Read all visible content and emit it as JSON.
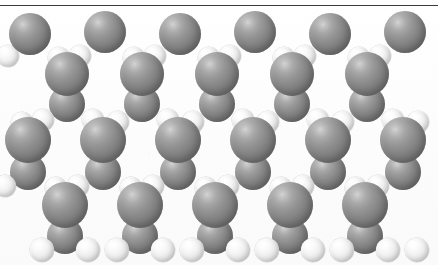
{
  "figure": {
    "title": "",
    "width": 438,
    "height": 265,
    "background_color": "#fdfdfd",
    "rule_color": "#3b3b3b",
    "style": "space-filling (CPK) model, grayscale halftone scan"
  },
  "legend": {
    "heavy_atom_label": "",
    "light_atom_label": "",
    "heavy_atom_color": "#8a8a8a",
    "light_atom_color": "#eeeeee"
  },
  "structure": {
    "description": "",
    "lattice_rows": 3,
    "repeat_units_across": 6,
    "horizontal_period_px": 75,
    "heavy_radius_px": 21,
    "light_radius_px": 11
  },
  "atoms": [
    {
      "id": "h-top-1",
      "kind": "heavy",
      "cx": 30,
      "cy": 34,
      "r": 21,
      "z": 30
    },
    {
      "id": "h-top-2",
      "kind": "heavy",
      "cx": 105,
      "cy": 32,
      "r": 21,
      "z": 30
    },
    {
      "id": "h-top-3",
      "kind": "heavy",
      "cx": 180,
      "cy": 34,
      "r": 21,
      "z": 30
    },
    {
      "id": "h-top-4",
      "kind": "heavy",
      "cx": 255,
      "cy": 32,
      "r": 21,
      "z": 30
    },
    {
      "id": "h-top-5",
      "kind": "heavy",
      "cx": 330,
      "cy": 34,
      "r": 21,
      "z": 30
    },
    {
      "id": "h-top-6",
      "kind": "heavy",
      "cx": 405,
      "cy": 32,
      "r": 21,
      "z": 30
    },
    {
      "id": "l-top-1",
      "cx": 59,
      "cy": 58,
      "r": 11,
      "kind": "light",
      "z": 28
    },
    {
      "id": "l-top-2",
      "cx": 80,
      "cy": 56,
      "r": 11,
      "kind": "light",
      "z": 28
    },
    {
      "id": "l-top-3",
      "cx": 134,
      "cy": 58,
      "r": 11,
      "kind": "light",
      "z": 28
    },
    {
      "id": "l-top-4",
      "cx": 155,
      "cy": 56,
      "r": 11,
      "kind": "light",
      "z": 28
    },
    {
      "id": "l-top-5",
      "cx": 209,
      "cy": 58,
      "r": 11,
      "kind": "light",
      "z": 28
    },
    {
      "id": "l-top-6",
      "cx": 230,
      "cy": 56,
      "r": 11,
      "kind": "light",
      "z": 28
    },
    {
      "id": "l-top-7",
      "cx": 284,
      "cy": 58,
      "r": 11,
      "kind": "light",
      "z": 28
    },
    {
      "id": "l-top-8",
      "cx": 305,
      "cy": 56,
      "r": 11,
      "kind": "light",
      "z": 28
    },
    {
      "id": "l-top-9",
      "cx": 359,
      "cy": 58,
      "r": 11,
      "kind": "light",
      "z": 28
    },
    {
      "id": "l-top-10",
      "cx": 380,
      "cy": 56,
      "r": 11,
      "kind": "light",
      "z": 28
    },
    {
      "id": "l-top-0",
      "cx": 8,
      "cy": 56,
      "r": 11,
      "kind": "light",
      "z": 28
    },
    {
      "id": "h-r1-1",
      "cx": 67,
      "cy": 74,
      "r": 22,
      "kind": "heavy",
      "z": 34
    },
    {
      "id": "h-r1-2",
      "cx": 142,
      "cy": 74,
      "r": 22,
      "kind": "heavy",
      "z": 34
    },
    {
      "id": "h-r1-3",
      "cx": 217,
      "cy": 74,
      "r": 22,
      "kind": "heavy",
      "z": 34
    },
    {
      "id": "h-r1-4",
      "cx": 292,
      "cy": 74,
      "r": 22,
      "kind": "heavy",
      "z": 34
    },
    {
      "id": "h-r1-5",
      "cx": 367,
      "cy": 74,
      "r": 22,
      "kind": "heavy",
      "z": 34
    },
    {
      "id": "h-r1b-1",
      "cx": 67,
      "cy": 104,
      "r": 18,
      "kind": "heavy",
      "z": 24
    },
    {
      "id": "h-r1b-2",
      "cx": 142,
      "cy": 104,
      "r": 18,
      "kind": "heavy",
      "z": 24
    },
    {
      "id": "h-r1b-3",
      "cx": 217,
      "cy": 104,
      "r": 18,
      "kind": "heavy",
      "z": 24
    },
    {
      "id": "h-r1b-4",
      "cx": 292,
      "cy": 104,
      "r": 18,
      "kind": "heavy",
      "z": 24
    },
    {
      "id": "h-r1b-5",
      "cx": 367,
      "cy": 104,
      "r": 18,
      "kind": "heavy",
      "z": 24
    },
    {
      "id": "l-m-1",
      "cx": 43,
      "cy": 120,
      "r": 11,
      "kind": "light",
      "z": 26
    },
    {
      "id": "l-m-2",
      "cx": 22,
      "cy": 123,
      "r": 11,
      "kind": "light",
      "z": 26
    },
    {
      "id": "l-m-3",
      "cx": 93,
      "cy": 120,
      "r": 11,
      "kind": "light",
      "z": 26
    },
    {
      "id": "l-m-4",
      "cx": 118,
      "cy": 122,
      "r": 11,
      "kind": "light",
      "z": 26
    },
    {
      "id": "l-m-5",
      "cx": 168,
      "cy": 120,
      "r": 11,
      "kind": "light",
      "z": 26
    },
    {
      "id": "l-m-6",
      "cx": 193,
      "cy": 122,
      "r": 11,
      "kind": "light",
      "z": 26
    },
    {
      "id": "l-m-7",
      "cx": 243,
      "cy": 120,
      "r": 11,
      "kind": "light",
      "z": 26
    },
    {
      "id": "l-m-8",
      "cx": 268,
      "cy": 122,
      "r": 11,
      "kind": "light",
      "z": 26
    },
    {
      "id": "l-m-9",
      "cx": 318,
      "cy": 120,
      "r": 11,
      "kind": "light",
      "z": 26
    },
    {
      "id": "l-m-10",
      "cx": 343,
      "cy": 122,
      "r": 11,
      "kind": "light",
      "z": 26
    },
    {
      "id": "l-m-11",
      "cx": 393,
      "cy": 120,
      "r": 11,
      "kind": "light",
      "z": 26
    },
    {
      "id": "l-m-12",
      "cx": 418,
      "cy": 122,
      "r": 11,
      "kind": "light",
      "z": 26
    },
    {
      "id": "h-mid-1",
      "cx": 28,
      "cy": 140,
      "r": 23,
      "kind": "heavy",
      "z": 40
    },
    {
      "id": "h-mid-2",
      "cx": 103,
      "cy": 140,
      "r": 23,
      "kind": "heavy",
      "z": 40
    },
    {
      "id": "h-mid-3",
      "cx": 178,
      "cy": 140,
      "r": 23,
      "kind": "heavy",
      "z": 40
    },
    {
      "id": "h-mid-4",
      "cx": 253,
      "cy": 140,
      "r": 23,
      "kind": "heavy",
      "z": 40
    },
    {
      "id": "h-mid-5",
      "cx": 328,
      "cy": 140,
      "r": 23,
      "kind": "heavy",
      "z": 40
    },
    {
      "id": "h-mid-6",
      "cx": 403,
      "cy": 140,
      "r": 23,
      "kind": "heavy",
      "z": 40
    },
    {
      "id": "h-mid-b1",
      "cx": 28,
      "cy": 172,
      "r": 18,
      "kind": "heavy",
      "z": 22
    },
    {
      "id": "h-mid-b2",
      "cx": 103,
      "cy": 172,
      "r": 18,
      "kind": "heavy",
      "z": 22
    },
    {
      "id": "h-mid-b3",
      "cx": 178,
      "cy": 172,
      "r": 18,
      "kind": "heavy",
      "z": 22
    },
    {
      "id": "h-mid-b4",
      "cx": 253,
      "cy": 172,
      "r": 18,
      "kind": "heavy",
      "z": 22
    },
    {
      "id": "h-mid-b5",
      "cx": 328,
      "cy": 172,
      "r": 18,
      "kind": "heavy",
      "z": 22
    },
    {
      "id": "h-mid-b6",
      "cx": 403,
      "cy": 172,
      "r": 18,
      "kind": "heavy",
      "z": 22
    },
    {
      "id": "l-b-1",
      "cx": 56,
      "cy": 188,
      "r": 11,
      "kind": "light",
      "z": 24
    },
    {
      "id": "l-b-2",
      "cx": 78,
      "cy": 186,
      "r": 11,
      "kind": "light",
      "z": 24
    },
    {
      "id": "l-b-3",
      "cx": 131,
      "cy": 188,
      "r": 11,
      "kind": "light",
      "z": 24
    },
    {
      "id": "l-b-4",
      "cx": 153,
      "cy": 186,
      "r": 11,
      "kind": "light",
      "z": 24
    },
    {
      "id": "l-b-5",
      "cx": 206,
      "cy": 188,
      "r": 11,
      "kind": "light",
      "z": 24
    },
    {
      "id": "l-b-6",
      "cx": 228,
      "cy": 186,
      "r": 11,
      "kind": "light",
      "z": 24
    },
    {
      "id": "l-b-7",
      "cx": 281,
      "cy": 188,
      "r": 11,
      "kind": "light",
      "z": 24
    },
    {
      "id": "l-b-8",
      "cx": 303,
      "cy": 186,
      "r": 11,
      "kind": "light",
      "z": 24
    },
    {
      "id": "l-b-9",
      "cx": 356,
      "cy": 188,
      "r": 11,
      "kind": "light",
      "z": 24
    },
    {
      "id": "l-b-10",
      "cx": 378,
      "cy": 186,
      "r": 11,
      "kind": "light",
      "z": 24
    },
    {
      "id": "l-b-0",
      "cx": 5,
      "cy": 186,
      "r": 11,
      "kind": "light",
      "z": 24
    },
    {
      "id": "h-bot-1",
      "cx": 65,
      "cy": 205,
      "r": 23,
      "kind": "heavy",
      "z": 38
    },
    {
      "id": "h-bot-2",
      "cx": 140,
      "cy": 205,
      "r": 23,
      "kind": "heavy",
      "z": 38
    },
    {
      "id": "h-bot-3",
      "cx": 215,
      "cy": 205,
      "r": 23,
      "kind": "heavy",
      "z": 38
    },
    {
      "id": "h-bot-4",
      "cx": 290,
      "cy": 205,
      "r": 23,
      "kind": "heavy",
      "z": 38
    },
    {
      "id": "h-bot-5",
      "cx": 365,
      "cy": 205,
      "r": 23,
      "kind": "heavy",
      "z": 38
    },
    {
      "id": "h-bot-b1",
      "cx": 65,
      "cy": 236,
      "r": 18,
      "kind": "heavy",
      "z": 20
    },
    {
      "id": "h-bot-b2",
      "cx": 140,
      "cy": 236,
      "r": 18,
      "kind": "heavy",
      "z": 20
    },
    {
      "id": "h-bot-b3",
      "cx": 215,
      "cy": 236,
      "r": 18,
      "kind": "heavy",
      "z": 20
    },
    {
      "id": "h-bot-b4",
      "cx": 290,
      "cy": 236,
      "r": 18,
      "kind": "heavy",
      "z": 20
    },
    {
      "id": "h-bot-b5",
      "cx": 365,
      "cy": 236,
      "r": 18,
      "kind": "heavy",
      "z": 20
    },
    {
      "id": "l-term-1",
      "cx": 42,
      "cy": 250,
      "r": 12,
      "kind": "light",
      "z": 42
    },
    {
      "id": "l-term-2",
      "cx": 88,
      "cy": 250,
      "r": 12,
      "kind": "light",
      "z": 42
    },
    {
      "id": "l-term-3",
      "cx": 117,
      "cy": 250,
      "r": 12,
      "kind": "light",
      "z": 42
    },
    {
      "id": "l-term-4",
      "cx": 163,
      "cy": 250,
      "r": 12,
      "kind": "light",
      "z": 42
    },
    {
      "id": "l-term-5",
      "cx": 192,
      "cy": 250,
      "r": 12,
      "kind": "light",
      "z": 42
    },
    {
      "id": "l-term-6",
      "cx": 238,
      "cy": 250,
      "r": 12,
      "kind": "light",
      "z": 42
    },
    {
      "id": "l-term-7",
      "cx": 267,
      "cy": 250,
      "r": 12,
      "kind": "light",
      "z": 42
    },
    {
      "id": "l-term-8",
      "cx": 313,
      "cy": 250,
      "r": 12,
      "kind": "light",
      "z": 42
    },
    {
      "id": "l-term-9",
      "cx": 342,
      "cy": 250,
      "r": 12,
      "kind": "light",
      "z": 42
    },
    {
      "id": "l-term-10",
      "cx": 388,
      "cy": 250,
      "r": 12,
      "kind": "light",
      "z": 42
    },
    {
      "id": "l-term-11",
      "cx": 417,
      "cy": 250,
      "r": 12,
      "kind": "light",
      "z": 42
    }
  ]
}
